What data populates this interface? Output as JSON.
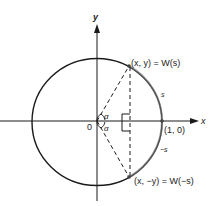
{
  "diagram": {
    "type": "unit-circle",
    "axes": {
      "x_label": "x",
      "y_label": "y",
      "origin_label": "0"
    },
    "points": {
      "top": "(x, y) = W(s)",
      "bottom": "(x, −y) = W(−s)",
      "unit": "(1, 0)"
    },
    "arc_labels": {
      "upper": "s",
      "lower": "−s"
    },
    "angle_labels": {
      "upper": "α",
      "lower": "α"
    },
    "colors": {
      "stroke": "#1a1a1a",
      "arc_highlight": "#7a7a7a",
      "background": "#ffffff"
    }
  }
}
